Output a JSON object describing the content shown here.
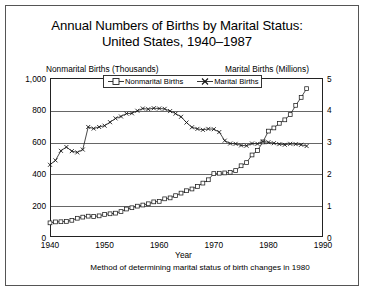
{
  "chart_data": {
    "type": "line",
    "title": "Annual Numbers of Births by Marital Status: United States, 1940–1987",
    "title_line1": "Annual Numbers of Births by Marital Status:",
    "title_line2": "United States, 1940–1987",
    "xlabel": "Year",
    "footnote": "Method of determining marital status of birth changes in 1980",
    "left_axis_label": "Nonmarital Births (Thousands)",
    "right_axis_label": "Marital Births (Millions)",
    "xlim": [
      1940,
      1990
    ],
    "xticks": [
      1940,
      1950,
      1960,
      1970,
      1980,
      1990
    ],
    "xtick_labels": [
      "1940",
      "1950",
      "1960",
      "1970",
      "1980",
      "1990"
    ],
    "ylim_left": [
      0,
      1000
    ],
    "yticks_left": [
      0,
      200,
      400,
      600,
      800,
      1000
    ],
    "ytick_labels_left": [
      "0",
      "200",
      "400",
      "600",
      "800",
      "1,000"
    ],
    "ylim_right": [
      0,
      5
    ],
    "yticks_right": [
      0,
      1,
      2,
      3,
      4,
      5
    ],
    "ytick_labels_right": [
      "0",
      "1",
      "2",
      "3",
      "4",
      "5"
    ],
    "grid": true,
    "legend_position": "top-center",
    "series": [
      {
        "name": "Nonmarital Births",
        "axis": "left",
        "units": "thousands",
        "marker": "square",
        "x": [
          1940,
          1941,
          1942,
          1943,
          1944,
          1945,
          1946,
          1947,
          1948,
          1949,
          1950,
          1951,
          1952,
          1953,
          1954,
          1955,
          1956,
          1957,
          1958,
          1959,
          1960,
          1961,
          1962,
          1963,
          1964,
          1965,
          1966,
          1967,
          1968,
          1969,
          1970,
          1971,
          1972,
          1973,
          1974,
          1975,
          1976,
          1977,
          1978,
          1979,
          1980,
          1981,
          1982,
          1983,
          1984,
          1985,
          1986,
          1987
        ],
        "values": [
          89,
          95,
          96,
          98,
          105,
          118,
          125,
          131,
          129,
          133,
          142,
          146,
          150,
          160,
          176,
          184,
          194,
          201,
          209,
          221,
          224,
          240,
          246,
          260,
          276,
          291,
          302,
          318,
          339,
          360,
          399,
          401,
          403,
          407,
          418,
          448,
          468,
          516,
          544,
          598,
          666,
          686,
          715,
          737,
          770,
          828,
          878,
          933
        ]
      },
      {
        "name": "Marital Births",
        "axis": "right",
        "units": "millions",
        "marker": "x",
        "x": [
          1940,
          1941,
          1942,
          1943,
          1944,
          1945,
          1946,
          1947,
          1948,
          1949,
          1950,
          1951,
          1952,
          1953,
          1954,
          1955,
          1956,
          1957,
          1958,
          1959,
          1960,
          1961,
          1962,
          1963,
          1964,
          1965,
          1966,
          1967,
          1968,
          1969,
          1970,
          1971,
          1972,
          1973,
          1974,
          1975,
          1976,
          1977,
          1978,
          1979,
          1980,
          1981,
          1982,
          1983,
          1984,
          1985,
          1986,
          1987
        ],
        "values": [
          2.27,
          2.41,
          2.71,
          2.83,
          2.7,
          2.66,
          2.75,
          3.46,
          3.41,
          3.46,
          3.5,
          3.61,
          3.73,
          3.79,
          3.88,
          3.89,
          3.97,
          4.04,
          4.02,
          4.05,
          4.04,
          4.03,
          3.96,
          3.88,
          3.78,
          3.6,
          3.45,
          3.4,
          3.37,
          3.4,
          3.39,
          3.3,
          3.03,
          2.94,
          2.93,
          2.88,
          2.87,
          2.94,
          2.93,
          3.0,
          2.98,
          2.95,
          2.92,
          2.9,
          2.93,
          2.92,
          2.9,
          2.86
        ]
      }
    ]
  },
  "legend": {
    "nonmarital_label": "Nonmarital Births",
    "marital_label": "Marital Births"
  }
}
